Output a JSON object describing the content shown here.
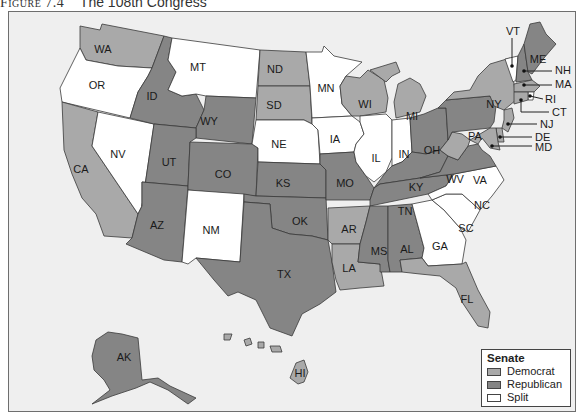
{
  "caption": {
    "figure_label": "Figure 7.4",
    "title": "The 108th Congress"
  },
  "colors": {
    "democrat": "#a9a9a9",
    "republican": "#858585",
    "split": "#ffffff",
    "water": "#efefef"
  },
  "legend": {
    "title": "Senate",
    "items": [
      {
        "label": "Democrat",
        "party": "democrat"
      },
      {
        "label": "Republican",
        "party": "republican"
      },
      {
        "label": "Split",
        "party": "split"
      }
    ]
  },
  "states": {
    "WA": "democrat",
    "OR": "split",
    "CA": "democrat",
    "NV": "split",
    "ID": "republican",
    "MT": "split",
    "WY": "republican",
    "UT": "republican",
    "AZ": "republican",
    "CO": "republican",
    "NM": "split",
    "ND": "democrat",
    "SD": "democrat",
    "NE": "split",
    "KS": "republican",
    "OK": "republican",
    "TX": "republican",
    "MN": "split",
    "IA": "split",
    "MO": "republican",
    "AR": "democrat",
    "LA": "democrat",
    "WI": "democrat",
    "IL": "split",
    "MI": "democrat",
    "IN": "split",
    "OH": "republican",
    "KY": "republican",
    "TN": "republican",
    "MS": "republican",
    "AL": "republican",
    "GA": "split",
    "FL": "democrat",
    "SC": "split",
    "NC": "split",
    "VA": "republican",
    "WV": "democrat",
    "PA": "republican",
    "NY": "democrat",
    "VT": "split",
    "NH": "republican",
    "ME": "republican",
    "MA": "democrat",
    "RI": "split",
    "CT": "democrat",
    "NJ": "democrat",
    "DE": "democrat",
    "MD": "democrat",
    "AK": "republican",
    "HI": "democrat"
  },
  "callouts": [
    "VT",
    "NH",
    "MA",
    "RI",
    "CT",
    "NJ",
    "DE",
    "MD"
  ]
}
